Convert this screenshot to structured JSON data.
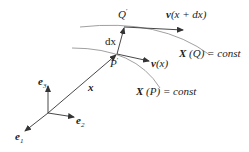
{
  "diagram": {
    "type": "vector-field-coordinates",
    "labels": {
      "e1": "e",
      "e1_sub": "1",
      "e2": "e",
      "e2_sub": "2",
      "e3": "e",
      "e3_sub": "3",
      "x": "x",
      "dx": "dx",
      "P": "P",
      "P_prime": "′",
      "Q": "Q",
      "Q_prime": "′",
      "v_x": "v",
      "v_x_arg": "(x)",
      "v_xdx": "v",
      "v_xdx_arg": "(x + dx)",
      "XQ_bold": "X",
      "XQ_rest": "(Q) = const",
      "XP_bold": "X",
      "XP_rest": "(P) = const"
    },
    "colors": {
      "lines": "#333333",
      "curves": "#888888"
    }
  }
}
